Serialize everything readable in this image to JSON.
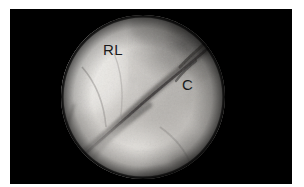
{
  "figure": {
    "name": "arthroscopy-photograph",
    "modality": "Wrist arthroscopy (endoscopic) still image",
    "background_color": "#ffffff",
    "frame_color": "#000000",
    "frame": {
      "x": 10,
      "y": 9,
      "width": 282,
      "height": 175
    },
    "field_of_view": {
      "shape": "circle",
      "center_x": 133,
      "center_y": 88,
      "radius": 82
    },
    "annotations": [
      {
        "id": "rl",
        "text": "RL",
        "meaning": "radiolunate ligament",
        "x": 93,
        "y": 33,
        "color": "#1a1a1a",
        "font_size": 15
      },
      {
        "id": "c",
        "text": "C",
        "meaning": "cartilage",
        "x": 172,
        "y": 68,
        "color": "#1a1a1a",
        "font_size": 15
      }
    ],
    "tissue": {
      "palette": {
        "highlight": "#e8e6e2",
        "bright": "#d2cfcb",
        "mid": "#a9a6a2",
        "shadow": "#6e6b68",
        "deep_shadow": "#3c3a38",
        "void": "#000000"
      },
      "features": [
        {
          "id": "bright-dome-left",
          "description": "bright convex ligament surface occupying the left half of the field"
        },
        {
          "id": "dark-mottled-upper-right",
          "description": "darker mottled cartilage surface in the upper right quadrant"
        },
        {
          "id": "diagonal-fissure",
          "description": "dark diagonal cleft running from upper right to lower left across the centre"
        },
        {
          "id": "lower-ridge",
          "description": "pale tissue ridge sweeping across the lower third of the field"
        },
        {
          "id": "vignette",
          "description": "circular vignette darkening toward the scope periphery"
        }
      ]
    }
  }
}
